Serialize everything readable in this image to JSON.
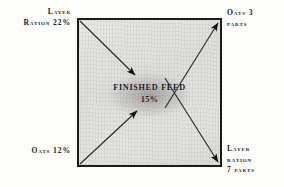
{
  "diagram": {
    "type": "feed-mixing-square",
    "center": {
      "title": "FINISHED FEED",
      "value": "15%"
    },
    "corners": {
      "top_left": {
        "line1": "Layer",
        "line2": "Ration 22%",
        "arrow": "inward",
        "role": "ingredient"
      },
      "top_right": {
        "line1": "Oats 3",
        "line2": "parts",
        "arrow": "outward",
        "role": "result"
      },
      "bottom_left": {
        "line1": "Oats 12%",
        "line2": "",
        "arrow": "inward",
        "role": "ingredient"
      },
      "bottom_right": {
        "line1": "Layer",
        "line2": "ration",
        "line3": "7 parts",
        "arrow": "outward",
        "role": "result"
      }
    },
    "colors": {
      "ink": "#1b1b1b",
      "text": "#232323",
      "box_fill": "#e4e4e2",
      "center_blob": "#8c8c8a"
    }
  }
}
